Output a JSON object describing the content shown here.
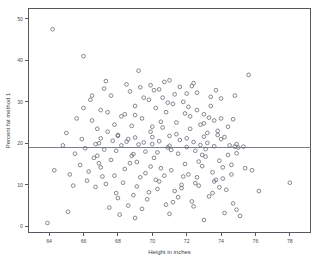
{
  "chart_data": {
    "type": "scatter",
    "title": "",
    "xlabel": "Height in inches",
    "ylabel": "Percent fat method 1",
    "xlim": [
      62.8,
      79.2
    ],
    "ylim": [
      -1.5,
      52.5
    ],
    "xticks": [
      64,
      66,
      68,
      70,
      72,
      74,
      76,
      78
    ],
    "xticklabels": [
      "64",
      "66",
      "68",
      "70",
      "72",
      "74",
      "76",
      "78"
    ],
    "yticks": [
      0,
      10,
      20,
      30,
      40,
      50
    ],
    "yticklabels": [
      "0",
      "10",
      "20",
      "30",
      "40",
      "50"
    ],
    "grid": false,
    "legend": null,
    "marker": "open-circle",
    "marker_color": "#6e747c",
    "reference_lines": [
      {
        "orientation": "horizontal",
        "value": 19.0,
        "color": "#7a8088"
      }
    ],
    "points": [
      [
        64.2,
        47.5
      ],
      [
        66.0,
        41.0
      ],
      [
        67.3,
        35.0
      ],
      [
        69.2,
        37.5
      ],
      [
        69.9,
        34.0
      ],
      [
        70.4,
        33.0
      ],
      [
        71.0,
        35.2
      ],
      [
        71.6,
        33.6
      ],
      [
        72.0,
        32.0
      ],
      [
        72.4,
        34.5
      ],
      [
        75.6,
        36.5
      ],
      [
        64.3,
        13.5
      ],
      [
        65.1,
        3.5
      ],
      [
        63.9,
        0.8
      ],
      [
        67.0,
        28.0
      ],
      [
        67.8,
        24.5
      ],
      [
        68.4,
        27.0
      ],
      [
        68.0,
        22.0
      ],
      [
        68.6,
        21.0
      ],
      [
        69.0,
        29.0
      ],
      [
        69.4,
        26.0
      ],
      [
        69.8,
        30.5
      ],
      [
        70.0,
        24.0
      ],
      [
        70.2,
        28.5
      ],
      [
        70.6,
        31.0
      ],
      [
        70.8,
        27.5
      ],
      [
        71.2,
        29.5
      ],
      [
        71.4,
        25.0
      ],
      [
        71.8,
        30.0
      ],
      [
        72.2,
        26.5
      ],
      [
        72.6,
        28.0
      ],
      [
        72.8,
        24.5
      ],
      [
        73.0,
        27.0
      ],
      [
        73.2,
        22.5
      ],
      [
        73.4,
        29.0
      ],
      [
        73.6,
        25.5
      ],
      [
        73.8,
        23.0
      ],
      [
        74.0,
        26.0
      ],
      [
        74.2,
        21.5
      ],
      [
        66.5,
        25.5
      ],
      [
        66.9,
        20.0
      ],
      [
        67.2,
        18.5
      ],
      [
        67.6,
        16.0
      ],
      [
        67.4,
        22.8
      ],
      [
        68.2,
        19.5
      ],
      [
        68.8,
        17.0
      ],
      [
        69.1,
        15.5
      ],
      [
        69.6,
        18.0
      ],
      [
        70.1,
        16.5
      ],
      [
        70.5,
        14.0
      ],
      [
        70.9,
        19.0
      ],
      [
        71.1,
        13.5
      ],
      [
        71.5,
        17.5
      ],
      [
        71.9,
        15.0
      ],
      [
        72.1,
        12.5
      ],
      [
        72.5,
        18.2
      ],
      [
        72.9,
        14.5
      ],
      [
        73.1,
        16.8
      ],
      [
        73.5,
        13.0
      ],
      [
        73.9,
        15.8
      ],
      [
        74.1,
        11.5
      ],
      [
        74.4,
        17.2
      ],
      [
        74.6,
        14.8
      ],
      [
        74.8,
        19.2
      ],
      [
        66.2,
        11.0
      ],
      [
        66.7,
        9.5
      ],
      [
        67.1,
        12.0
      ],
      [
        67.9,
        8.0
      ],
      [
        68.3,
        10.5
      ],
      [
        68.9,
        7.5
      ],
      [
        69.3,
        11.8
      ],
      [
        69.7,
        6.5
      ],
      [
        70.3,
        9.0
      ],
      [
        70.7,
        12.2
      ],
      [
        71.3,
        8.5
      ],
      [
        71.7,
        10.0
      ],
      [
        72.3,
        6.0
      ],
      [
        72.7,
        9.8
      ],
      [
        73.3,
        7.2
      ],
      [
        73.7,
        11.2
      ],
      [
        74.3,
        8.8
      ],
      [
        74.7,
        5.5
      ],
      [
        75.0,
        19.0
      ],
      [
        75.3,
        19.2
      ],
      [
        76.2,
        8.5
      ],
      [
        78.0,
        10.5
      ],
      [
        74.9,
        4.0
      ],
      [
        75.1,
        2.5
      ],
      [
        71.0,
        3.0
      ],
      [
        73.0,
        1.5
      ],
      [
        69.0,
        2.0
      ],
      [
        67.5,
        4.5
      ],
      [
        68.1,
        2.8
      ],
      [
        69.5,
        20.2
      ],
      [
        70.0,
        19.8
      ],
      [
        70.4,
        20.5
      ],
      [
        71.0,
        19.4
      ],
      [
        71.6,
        20.8
      ],
      [
        72.0,
        19.1
      ],
      [
        72.4,
        20.3
      ],
      [
        72.8,
        19.6
      ],
      [
        73.2,
        20.1
      ],
      [
        73.6,
        19.3
      ],
      [
        68.5,
        20.4
      ],
      [
        69.2,
        19.7
      ],
      [
        67.7,
        20.6
      ],
      [
        74.5,
        19.5
      ],
      [
        74.9,
        19.8
      ],
      [
        66.4,
        30.5
      ],
      [
        66.8,
        23.5
      ],
      [
        67.6,
        31.5
      ],
      [
        68.7,
        32.5
      ],
      [
        69.5,
        31.0
      ],
      [
        70.1,
        32.8
      ],
      [
        71.3,
        31.8
      ],
      [
        72.6,
        32.2
      ],
      [
        73.4,
        31.2
      ],
      [
        74.0,
        30.8
      ],
      [
        66.6,
        16.5
      ],
      [
        67.0,
        14.2
      ],
      [
        65.5,
        17.5
      ],
      [
        65.8,
        14.8
      ],
      [
        65.9,
        21.0
      ],
      [
        66.1,
        18.8
      ],
      [
        68.8,
        24.2
      ],
      [
        69.9,
        22.8
      ],
      [
        70.6,
        23.8
      ],
      [
        71.4,
        22.2
      ],
      [
        72.2,
        23.5
      ],
      [
        73.0,
        24.8
      ],
      [
        73.8,
        22.0
      ],
      [
        74.4,
        24.0
      ],
      [
        67.3,
        10.2
      ],
      [
        66.3,
        13.2
      ],
      [
        65.4,
        9.8
      ],
      [
        68.6,
        5.0
      ],
      [
        70.8,
        5.2
      ],
      [
        72.4,
        4.8
      ],
      [
        74.2,
        3.2
      ],
      [
        69.4,
        4.2
      ],
      [
        71.2,
        5.8
      ],
      [
        68.4,
        13.8
      ],
      [
        69.6,
        12.8
      ],
      [
        70.2,
        11.2
      ],
      [
        71.8,
        12.0
      ],
      [
        72.6,
        11.8
      ],
      [
        73.6,
        10.8
      ],
      [
        74.6,
        12.5
      ],
      [
        67.8,
        12.2
      ],
      [
        66.9,
        15.2
      ],
      [
        69.0,
        26.8
      ],
      [
        70.5,
        25.2
      ],
      [
        71.9,
        27.2
      ],
      [
        73.3,
        26.2
      ],
      [
        74.7,
        25.8
      ],
      [
        68.2,
        26.5
      ],
      [
        67.4,
        27.5
      ],
      [
        72.1,
        28.8
      ],
      [
        70.9,
        29.8
      ],
      [
        69.8,
        8.2
      ],
      [
        71.5,
        7.0
      ],
      [
        73.5,
        8.0
      ],
      [
        68.0,
        6.8
      ],
      [
        75.4,
        14.0
      ],
      [
        75.8,
        13.5
      ],
      [
        64.8,
        19.5
      ],
      [
        65.2,
        12.5
      ],
      [
        65.6,
        26.0
      ],
      [
        65.0,
        22.5
      ],
      [
        66.0,
        28.5
      ],
      [
        66.5,
        31.5
      ],
      [
        67.2,
        33.2
      ],
      [
        68.5,
        34.2
      ],
      [
        69.3,
        33.5
      ],
      [
        70.7,
        34.8
      ],
      [
        72.3,
        33.8
      ],
      [
        73.7,
        32.8
      ],
      [
        74.8,
        31.5
      ],
      [
        70.0,
        21.5
      ],
      [
        71.0,
        21.8
      ],
      [
        72.0,
        21.2
      ],
      [
        73.0,
        21.6
      ],
      [
        74.0,
        21.0
      ],
      [
        69.0,
        21.4
      ],
      [
        68.0,
        21.8
      ],
      [
        67.0,
        21.2
      ],
      [
        70.3,
        17.8
      ],
      [
        71.1,
        18.4
      ],
      [
        72.9,
        17.2
      ],
      [
        73.1,
        18.6
      ],
      [
        74.9,
        17.6
      ],
      [
        68.9,
        17.4
      ],
      [
        67.9,
        18.2
      ],
      [
        66.8,
        17.0
      ],
      [
        71.7,
        9.2
      ],
      [
        72.5,
        10.4
      ],
      [
        73.9,
        9.4
      ],
      [
        70.4,
        10.8
      ],
      [
        69.1,
        9.6
      ],
      [
        68.7,
        15.2
      ],
      [
        69.9,
        14.4
      ],
      [
        72.7,
        15.6
      ],
      [
        74.1,
        14.2
      ],
      [
        66.7,
        19.8
      ]
    ]
  }
}
